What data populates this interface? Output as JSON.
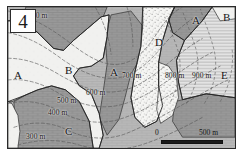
{
  "figure": {
    "panel_number": "4",
    "alt_description": "Geological map panel showing lettered rock units A through E with elevation contour lines"
  },
  "units": [
    {
      "id": "unit-a-left",
      "label": "A",
      "x": 14,
      "y": 76
    },
    {
      "id": "unit-b-center",
      "label": "B",
      "x": 65,
      "y": 71
    },
    {
      "id": "unit-a-center",
      "label": "A",
      "x": 110,
      "y": 73
    },
    {
      "id": "unit-d-upper",
      "label": "D",
      "x": 155,
      "y": 43
    },
    {
      "id": "unit-a-upper-right",
      "label": "A",
      "x": 192,
      "y": 21
    },
    {
      "id": "unit-b-upper-right",
      "label": "B",
      "x": 222,
      "y": 18
    },
    {
      "id": "unit-e-right",
      "label": "E",
      "x": 221,
      "y": 76
    },
    {
      "id": "unit-c-lower",
      "label": "C",
      "x": 65,
      "y": 132
    }
  ],
  "contours": [
    {
      "id": "contour-300-top",
      "label": "300 m",
      "x": 28,
      "y": 16
    },
    {
      "id": "contour-600",
      "label": "600 m",
      "x": 86,
      "y": 93
    },
    {
      "id": "contour-500",
      "label": "500 m",
      "x": 57,
      "y": 101
    },
    {
      "id": "contour-400",
      "label": "400 m",
      "x": 48,
      "y": 113
    },
    {
      "id": "contour-300-bottom",
      "label": "300 m",
      "x": 26,
      "y": 137
    },
    {
      "id": "contour-700",
      "label": "700 m",
      "x": 122,
      "y": 76
    },
    {
      "id": "contour-800",
      "label": "800 m",
      "x": 165,
      "y": 76
    },
    {
      "id": "contour-900",
      "label": "900 m",
      "x": 192,
      "y": 76
    }
  ],
  "scalebar": {
    "zero_label": "0",
    "max_label": "500 m"
  },
  "colors": {
    "unit_a_fill": "#9b9b9b",
    "unit_b_fill": "#f0f0ee",
    "unit_c_fill": "#9d9d9d",
    "unit_d_fill": "#f4f4f2",
    "unit_e_fill": "#dcdcdc",
    "background_fill": "#bdbdbd",
    "contour_line": "#5e5e5e",
    "boundary_line": "#2a2a2a",
    "frame": "#2a2a2a",
    "text": "#141414"
  }
}
